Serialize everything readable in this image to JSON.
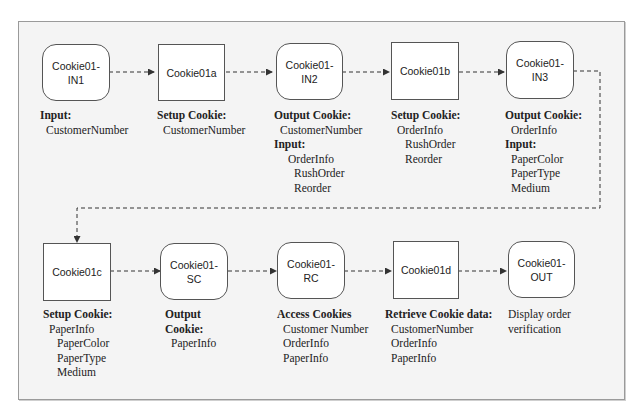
{
  "diagram": {
    "title": "",
    "colors": {
      "background": "#f4f4f4",
      "frame_border": "#9a9a9a",
      "node_fill": "#ffffff",
      "node_border": "#555555",
      "connector": "#333333"
    },
    "nodes": [
      {
        "id": "in1",
        "shape": "rounded",
        "line1": "Cookie01-",
        "line2": "IN1"
      },
      {
        "id": "c01a",
        "shape": "square",
        "line1": "Cookie01a",
        "line2": ""
      },
      {
        "id": "in2",
        "shape": "rounded",
        "line1": "Cookie01-",
        "line2": "IN2"
      },
      {
        "id": "c01b",
        "shape": "square",
        "line1": "Cookie01b",
        "line2": ""
      },
      {
        "id": "in3",
        "shape": "rounded",
        "line1": "Cookie01-",
        "line2": "IN3"
      },
      {
        "id": "c01c",
        "shape": "square",
        "line1": "Cookie01c",
        "line2": ""
      },
      {
        "id": "sc",
        "shape": "rounded",
        "line1": "Cookie01-",
        "line2": "SC"
      },
      {
        "id": "rc",
        "shape": "rounded",
        "line1": "Cookie01-",
        "line2": "RC"
      },
      {
        "id": "c01d",
        "shape": "square",
        "line1": "Cookie01d",
        "line2": ""
      },
      {
        "id": "out",
        "shape": "rounded",
        "line1": "Cookie01-",
        "line2": "OUT"
      }
    ],
    "edges": [
      {
        "from": "in1",
        "to": "c01a",
        "style": "dashed"
      },
      {
        "from": "c01a",
        "to": "in2",
        "style": "dashed"
      },
      {
        "from": "in2",
        "to": "c01b",
        "style": "dashed"
      },
      {
        "from": "c01b",
        "to": "in3",
        "style": "dashed"
      },
      {
        "from": "in3",
        "to": "c01c",
        "style": "dashed"
      },
      {
        "from": "c01c",
        "to": "sc",
        "style": "dashed"
      },
      {
        "from": "sc",
        "to": "rc",
        "style": "dashed"
      },
      {
        "from": "rc",
        "to": "c01d",
        "style": "dashed"
      },
      {
        "from": "c01d",
        "to": "out",
        "style": "dashed"
      }
    ],
    "annotations": {
      "in1": {
        "heading": "Input:",
        "items": [
          "CustomerNumber"
        ]
      },
      "c01a": {
        "heading": "Setup Cookie:",
        "items": [
          "CustomerNumber"
        ]
      },
      "in2": {
        "heading": "Output Cookie:",
        "items": [
          "CustomerNumber"
        ],
        "heading2": "Input:",
        "items2": [
          "OrderInfo"
        ],
        "subitems2": [
          "RushOrder",
          "Reorder"
        ]
      },
      "c01b": {
        "heading": "Setup Cookie:",
        "items": [
          "OrderInfo"
        ],
        "subitems": [
          "RushOrder",
          "Reorder"
        ]
      },
      "in3": {
        "heading": "Output Cookie:",
        "items": [
          "OrderInfo"
        ],
        "heading2": "Input:",
        "items2": [
          "PaperColor",
          "PaperType",
          "Medium"
        ]
      },
      "c01c": {
        "heading": "Setup Cookie:",
        "items": [
          "PaperInfo"
        ],
        "subitems": [
          "PaperColor",
          "PaperType",
          "Medium"
        ]
      },
      "sc": {
        "heading_line1": "Output",
        "heading_line2": "Cookie:",
        "items": [
          "PaperInfo"
        ]
      },
      "rc": {
        "heading": "Access Cookies",
        "items": [
          "Customer Number",
          "OrderInfo",
          "PaperInfo"
        ]
      },
      "c01d": {
        "heading": "Retrieve Cookie data:",
        "items": [
          "CustomerNumber",
          "OrderInfo",
          "PaperInfo"
        ]
      },
      "out": {
        "text_line1": "Display order",
        "text_line2": "verification"
      }
    }
  }
}
